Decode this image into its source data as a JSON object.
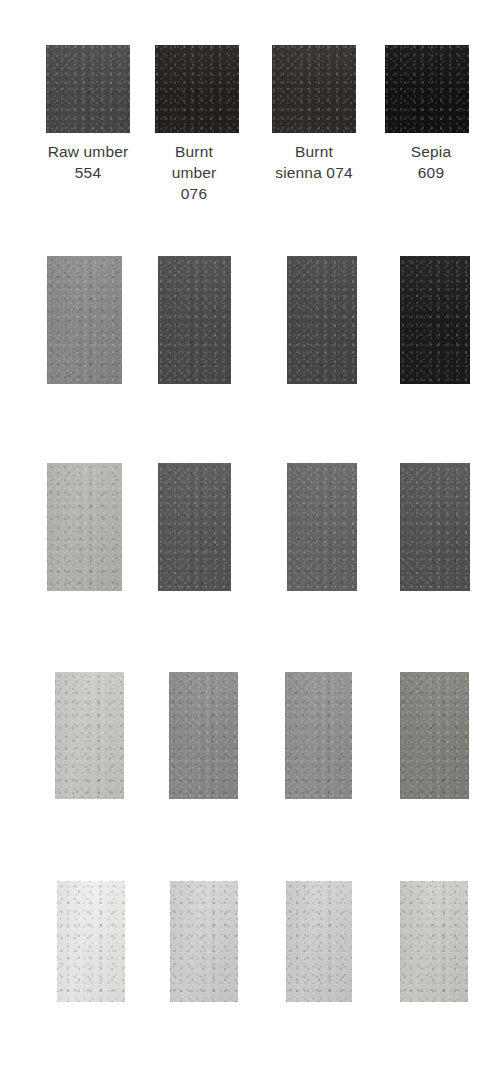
{
  "chart_data": {
    "type": "table",
    "title": "",
    "columns": [
      {
        "name": "Raw umber 554",
        "label_lines": "Raw umber\n554",
        "index": 0
      },
      {
        "name": "Burnt umber 076",
        "label_lines": "Burnt\number\n076",
        "index": 1
      },
      {
        "name": "Burnt sienna 074",
        "label_lines": "Burnt\nsienna 074",
        "index": 2
      },
      {
        "name": "Sepia 609",
        "label_lines": "Sepia\n609",
        "index": 3
      }
    ],
    "row_labels": [
      "full strength",
      "dilution 1",
      "dilution 2",
      "dilution 3",
      "dilution 4"
    ],
    "series": [
      {
        "name": "Raw umber 554",
        "values": [
          "#4b4a48",
          "#8d8c8a",
          "#b9b8b4",
          "#cdccc8",
          "#efeeec"
        ]
      },
      {
        "name": "Burnt umber 076",
        "values": [
          "#26211f",
          "#4e4d4c",
          "#59585a",
          "#8e8e8c",
          "#d6d5d3"
        ]
      },
      {
        "name": "Burnt sienna 074",
        "values": [
          "#312d2b",
          "#4a4947",
          "#6a6866",
          "#959492",
          "#d2d2d0"
        ]
      },
      {
        "name": "Sepia 609",
        "values": [
          "#141313",
          "#1d1c1c",
          "#565554",
          "#85847f",
          "#cfcecb"
        ]
      }
    ],
    "swatch_grid": [
      {
        "row": 0,
        "top": 45,
        "height": 88,
        "cells": [
          {
            "left": 46,
            "width": 84,
            "color": "#4b4a48",
            "pigment": "Raw umber 554"
          },
          {
            "left": 155,
            "width": 84,
            "color": "#26211f",
            "pigment": "Burnt umber 076"
          },
          {
            "left": 272,
            "width": 84,
            "color": "#312d2b",
            "pigment": "Burnt sienna 074"
          },
          {
            "left": 385,
            "width": 84,
            "color": "#141313",
            "pigment": "Sepia 609"
          }
        ]
      },
      {
        "row": 1,
        "top": 256,
        "height": 128,
        "cells": [
          {
            "left": 47,
            "width": 75,
            "color": "#8d8c8a",
            "pigment": "Raw umber 554"
          },
          {
            "left": 158,
            "width": 73,
            "color": "#4e4d4c",
            "pigment": "Burnt umber 076"
          },
          {
            "left": 287,
            "width": 70,
            "color": "#4a4947",
            "pigment": "Burnt sienna 074"
          },
          {
            "left": 400,
            "width": 70,
            "color": "#1d1c1c",
            "pigment": "Sepia 609"
          }
        ]
      },
      {
        "row": 2,
        "top": 463,
        "height": 128,
        "cells": [
          {
            "left": 47,
            "width": 75,
            "color": "#b9b8b4",
            "pigment": "Raw umber 554"
          },
          {
            "left": 158,
            "width": 73,
            "color": "#59585a",
            "pigment": "Burnt umber 076"
          },
          {
            "left": 287,
            "width": 70,
            "color": "#6a6866",
            "pigment": "Burnt sienna 074"
          },
          {
            "left": 400,
            "width": 70,
            "color": "#565554",
            "pigment": "Sepia 609"
          }
        ]
      },
      {
        "row": 3,
        "top": 672,
        "height": 127,
        "cells": [
          {
            "left": 55,
            "width": 69,
            "color": "#cdccc8",
            "pigment": "Raw umber 554"
          },
          {
            "left": 169,
            "width": 69,
            "color": "#8e8e8c",
            "pigment": "Burnt umber 076"
          },
          {
            "left": 285,
            "width": 67,
            "color": "#959492",
            "pigment": "Burnt sienna 074"
          },
          {
            "left": 400,
            "width": 69,
            "color": "#85847f",
            "pigment": "Sepia 609"
          }
        ]
      },
      {
        "row": 4,
        "top": 881,
        "height": 121,
        "cells": [
          {
            "left": 57,
            "width": 68,
            "color": "#efeeec",
            "pigment": "Raw umber 554"
          },
          {
            "left": 170,
            "width": 68,
            "color": "#d6d5d3",
            "pigment": "Burnt umber 076"
          },
          {
            "left": 286,
            "width": 66,
            "color": "#d2d2d0",
            "pigment": "Burnt sienna 074"
          },
          {
            "left": 400,
            "width": 68,
            "color": "#cfcecb",
            "pigment": "Sepia 609"
          }
        ]
      }
    ],
    "labels": {
      "top": 141,
      "items": [
        {
          "left": 14,
          "width": 148,
          "text": "Raw umber\n554"
        },
        {
          "left": 130,
          "width": 128,
          "text": "Burnt\number\n076"
        },
        {
          "left": 255,
          "width": 118,
          "text": "Burnt\nsienna 074"
        },
        {
          "left": 372,
          "width": 118,
          "text": "Sepia\n609"
        }
      ]
    },
    "colors": {
      "background": "#ffffff",
      "text": "#3b3b3b"
    }
  }
}
